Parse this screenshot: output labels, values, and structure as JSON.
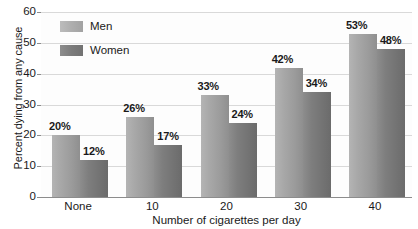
{
  "chart_data": {
    "type": "bar",
    "title": "",
    "xlabel": "Number of cigarettes per day",
    "ylabel": "Percent dying from any cause",
    "categories": [
      "None",
      "10",
      "20",
      "30",
      "40"
    ],
    "series": [
      {
        "name": "Men",
        "color": "#a8a8a8",
        "values": [
          20,
          26,
          33,
          42,
          53
        ],
        "labels": [
          "20%",
          "26%",
          "33%",
          "42%",
          "53%"
        ]
      },
      {
        "name": "Women",
        "color": "#7a7a7a",
        "values": [
          12,
          17,
          24,
          34,
          48
        ],
        "labels": [
          "12%",
          "17%",
          "24%",
          "34%",
          "48%"
        ]
      }
    ],
    "ylim": [
      0,
      60
    ],
    "yticks": [
      0,
      10,
      20,
      30,
      40,
      50,
      60
    ],
    "ytick_labels": [
      "0",
      "10",
      "20",
      "30",
      "40",
      "50",
      "60"
    ],
    "grid": true,
    "legend_position": "top-left-inside"
  },
  "axes": {
    "y_title": "Percent dying from any cause",
    "x_title": "Number of cigarettes per day"
  },
  "legend": {
    "items": [
      {
        "label": "Men"
      },
      {
        "label": "Women"
      }
    ]
  }
}
